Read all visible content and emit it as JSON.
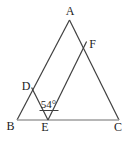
{
  "diagram": {
    "vertex_labels": {
      "a": "A",
      "b": "B",
      "c": "C",
      "d": "D",
      "e": "E",
      "f": "F"
    },
    "angle_label": "54°",
    "colors": {
      "line": "#3f3f3f",
      "baseline": "#9e9e9e",
      "label": "#222222",
      "background": "#ffffff"
    }
  }
}
